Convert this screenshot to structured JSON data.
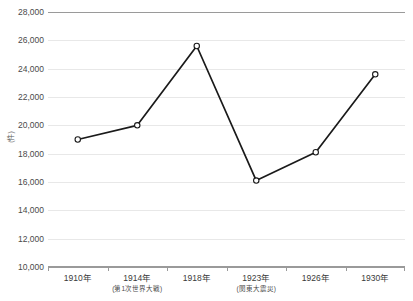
{
  "chart_data": {
    "type": "line",
    "title": "",
    "xlabel": "",
    "ylabel": "(件)",
    "categories": [
      "1910年",
      "1914年",
      "1918年",
      "1923年",
      "1926年",
      "1930年"
    ],
    "category_notes": [
      "",
      "(第1次世界大戦)",
      "",
      "(関東大震災)",
      "",
      ""
    ],
    "values": [
      19000,
      20000,
      25600,
      16100,
      18100,
      23600
    ],
    "series": [
      {
        "name": "件数",
        "values": [
          19000,
          20000,
          25600,
          16100,
          18100,
          23600
        ]
      }
    ],
    "ylim": [
      10000,
      28000
    ],
    "ytick_step": 2000,
    "yticks": [
      10000,
      12000,
      14000,
      16000,
      18000,
      20000,
      22000,
      24000,
      26000,
      28000
    ],
    "ytick_labels": [
      "10,000",
      "12,000",
      "14,000",
      "16,000",
      "18,000",
      "20,000",
      "22,000",
      "24,000",
      "26,000",
      "28,000"
    ],
    "grid": true,
    "legend": false,
    "legend_position": "none",
    "marker": "circle-open",
    "line_color": "#1a1a1a",
    "marker_fill": "#ffffff",
    "marker_stroke": "#1a1a1a",
    "grid_color": "#e8e8e8",
    "axis_color": "#9a9a9a",
    "background_color": "#ffffff"
  }
}
